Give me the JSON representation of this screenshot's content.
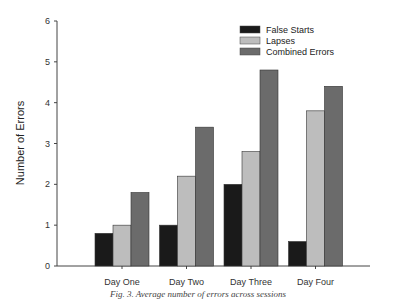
{
  "chart_data": {
    "type": "bar",
    "title": "",
    "xlabel": "",
    "ylabel": "Number of Errors",
    "ylim": [
      0,
      6
    ],
    "yticks": [
      0,
      1,
      2,
      3,
      4,
      5,
      6
    ],
    "grid": false,
    "legend_position": "upper right",
    "categories": [
      "Day One",
      "Day Two",
      "Day Three",
      "Day Four"
    ],
    "series": [
      {
        "name": "False Starts",
        "color": "#1a1a1a",
        "values": [
          0.8,
          1.0,
          2.0,
          0.6
        ]
      },
      {
        "name": "Lapses",
        "color": "#bdbdbd",
        "values": [
          1.0,
          2.2,
          2.8,
          3.8
        ]
      },
      {
        "name": "Combined Errors",
        "color": "#6b6b6b",
        "values": [
          1.8,
          3.4,
          4.8,
          4.4
        ]
      }
    ]
  },
  "caption": "Fig. 3. Average number of errors across sessions"
}
